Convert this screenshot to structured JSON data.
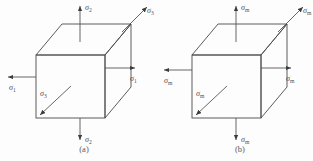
{
  "figure": {
    "background_color": "#fdfdfd",
    "line_color": "#4a4a4a",
    "arrow_color": "#555555",
    "label_color": "#4d4d4d",
    "sigma_glyph": "σ"
  },
  "panels": [
    {
      "id": "a",
      "caption": "(a)",
      "caption_x": 84,
      "caption_y": 152,
      "cube": {
        "front": {
          "x": 36,
          "y": 55,
          "w": 69,
          "h": 63
        },
        "depth_dx": 26,
        "depth_dy": -31
      },
      "arrows": [
        {
          "name": "sigma-1-left",
          "symbol": "σ",
          "subscript": "1",
          "direction": "left",
          "x1": 36,
          "y1": 77,
          "x2": 8,
          "y2": 77,
          "label_x": 9,
          "label_y": 90
        },
        {
          "name": "sigma-1-right",
          "symbol": "σ",
          "subscript": "1",
          "direction": "right",
          "x1": 105,
          "y1": 68,
          "x2": 135,
          "y2": 68,
          "label_x": 130,
          "label_y": 81
        },
        {
          "name": "sigma-2-top",
          "symbol": "σ",
          "subscript": "2",
          "direction": "up",
          "x1": 80,
          "y1": 42,
          "x2": 80,
          "y2": 6,
          "label_x": 85,
          "label_y": 10
        },
        {
          "name": "sigma-2-bottom",
          "symbol": "σ",
          "subscript": "2",
          "direction": "down",
          "x1": 80,
          "y1": 118,
          "x2": 80,
          "y2": 140,
          "label_x": 85,
          "label_y": 142
        },
        {
          "name": "sigma-3-front",
          "symbol": "σ",
          "subscript": "3",
          "direction": "down-left",
          "x1": 71,
          "y1": 86,
          "x2": 40,
          "y2": 115,
          "label_x": 40,
          "label_y": 96
        },
        {
          "name": "sigma-3-back",
          "symbol": "σ",
          "subscript": "3",
          "direction": "up-right",
          "x1": 122,
          "y1": 32,
          "x2": 147,
          "y2": 7,
          "label_x": 147,
          "label_y": 13
        }
      ]
    },
    {
      "id": "b",
      "caption": "(b)",
      "caption_x": 240,
      "caption_y": 152,
      "cube": {
        "front": {
          "x": 192,
          "y": 55,
          "w": 69,
          "h": 63
        },
        "depth_dx": 26,
        "depth_dy": -31
      },
      "arrows": [
        {
          "name": "sigma-m-left",
          "symbol": "σ",
          "subscript": "m",
          "direction": "left",
          "x1": 192,
          "y1": 70,
          "x2": 164,
          "y2": 70,
          "label_x": 164,
          "label_y": 83
        },
        {
          "name": "sigma-m-right",
          "symbol": "σ",
          "subscript": "m",
          "direction": "right",
          "x1": 261,
          "y1": 68,
          "x2": 291,
          "y2": 68,
          "label_x": 286,
          "label_y": 81
        },
        {
          "name": "sigma-m-top",
          "symbol": "σ",
          "subscript": "m",
          "direction": "up",
          "x1": 236,
          "y1": 42,
          "x2": 236,
          "y2": 6,
          "label_x": 241,
          "label_y": 10
        },
        {
          "name": "sigma-m-bottom",
          "symbol": "σ",
          "subscript": "m",
          "direction": "down",
          "x1": 236,
          "y1": 118,
          "x2": 236,
          "y2": 140,
          "label_x": 241,
          "label_y": 142
        },
        {
          "name": "sigma-m-front",
          "symbol": "σ",
          "subscript": "m",
          "direction": "down-left",
          "x1": 227,
          "y1": 86,
          "x2": 196,
          "y2": 115,
          "label_x": 196,
          "label_y": 96
        },
        {
          "name": "sigma-m-back",
          "symbol": "σ",
          "subscript": "m",
          "direction": "up-right",
          "x1": 278,
          "y1": 32,
          "x2": 303,
          "y2": 7,
          "label_x": 303,
          "label_y": 13
        }
      ]
    }
  ]
}
